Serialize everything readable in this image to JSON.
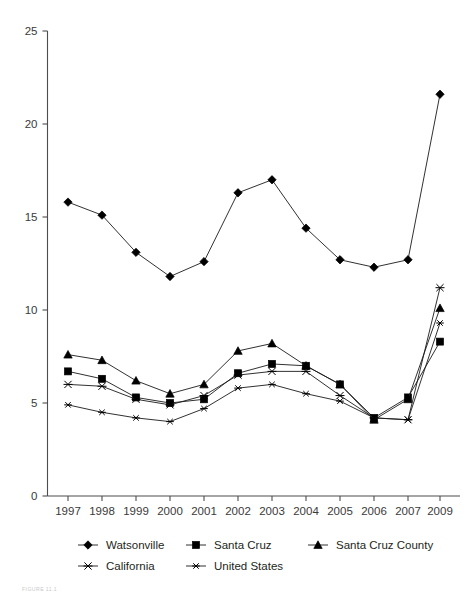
{
  "figure": {
    "caption": "FIGURE 11.1"
  },
  "chart_data": {
    "type": "line",
    "title": "",
    "subtitle": "",
    "xlabel": "",
    "ylabel": "",
    "grid": false,
    "legend_position": "bottom",
    "ylim": [
      0,
      25
    ],
    "yticks": [
      0,
      5,
      10,
      15,
      20,
      25
    ],
    "ytick_labels": [
      "0",
      "5",
      "10",
      "15",
      "20",
      "25"
    ],
    "categories": [
      "1997",
      "1998",
      "1999",
      "2000",
      "2001",
      "2002",
      "2003",
      "2004",
      "2005",
      "2006",
      "2007",
      "2009"
    ],
    "series": [
      {
        "name": "Watsonville",
        "marker": "diamond-filled",
        "values": [
          15.8,
          15.1,
          13.1,
          11.8,
          12.6,
          16.3,
          17.0,
          14.4,
          12.7,
          12.3,
          12.7,
          21.6
        ]
      },
      {
        "name": "Santa Cruz",
        "marker": "square-filled",
        "values": [
          6.7,
          6.3,
          5.3,
          5.0,
          5.2,
          6.6,
          7.1,
          7.0,
          6.0,
          4.2,
          5.3,
          8.3
        ]
      },
      {
        "name": "Santa Cruz County",
        "marker": "triangle-filled",
        "values": [
          7.6,
          7.3,
          6.2,
          5.5,
          6.0,
          7.8,
          8.2,
          7.0,
          6.0,
          4.1,
          5.2,
          10.1
        ]
      },
      {
        "name": "California",
        "marker": "x-open",
        "values": [
          6.0,
          5.9,
          5.2,
          4.9,
          5.4,
          6.5,
          6.7,
          6.7,
          5.4,
          4.2,
          4.1,
          11.2
        ]
      },
      {
        "name": "United States",
        "marker": "asterisk-open",
        "values": [
          4.9,
          4.5,
          4.2,
          4.0,
          4.7,
          5.8,
          6.0,
          5.5,
          5.1,
          4.2,
          4.1,
          9.3
        ]
      }
    ],
    "legend_entries": [
      {
        "label": "Watsonville",
        "marker": "diamond-filled"
      },
      {
        "label": "Santa Cruz",
        "marker": "square-filled"
      },
      {
        "label": "Santa Cruz County",
        "marker": "triangle-filled"
      },
      {
        "label": "California",
        "marker": "x-open"
      },
      {
        "label": "United States",
        "marker": "asterisk-open"
      }
    ],
    "colors": {
      "series": "#000000",
      "axis": "#4d4d4d",
      "text": "#231f20",
      "background": "#ffffff"
    }
  }
}
